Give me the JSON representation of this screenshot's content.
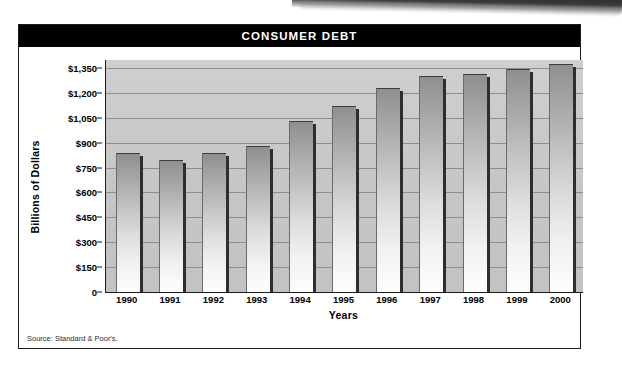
{
  "card": {
    "title": "CONSUMER DEBT",
    "source": "Source: Standard & Poor's."
  },
  "chart_data": {
    "type": "bar",
    "title": "CONSUMER DEBT",
    "xlabel": "Years",
    "ylabel": "Billions of Dollars",
    "categories": [
      "1990",
      "1991",
      "1992",
      "1993",
      "1994",
      "1995",
      "1996",
      "1997",
      "1998",
      "1999",
      "2000"
    ],
    "values": [
      840,
      795,
      840,
      880,
      1030,
      1120,
      1230,
      1300,
      1315,
      1345,
      1375
    ],
    "ylim": [
      0,
      1400
    ],
    "yticks": [
      0,
      150,
      300,
      450,
      600,
      750,
      900,
      1050,
      1200,
      1350
    ],
    "ytick_labels": [
      "0",
      "$150",
      "$300",
      "$450",
      "$600",
      "$750",
      "$900",
      "$1,050",
      "$1,200",
      "$1,350"
    ],
    "grid": true,
    "legend": "none",
    "series": [
      {
        "name": "Consumer Debt",
        "values": [
          840,
          795,
          840,
          880,
          1030,
          1120,
          1230,
          1300,
          1315,
          1345,
          1375
        ]
      }
    ],
    "colors": {
      "title_bar": "#000000",
      "title_text": "#ffffff",
      "plot_background": "#c6c6c6",
      "gridline": "#8e8e8e",
      "bar_top": "#8f8f8f",
      "bar_bottom": "#fdfdfd",
      "bar_shadow": "#2e2e2e",
      "axis": "#1a1a1a"
    }
  }
}
